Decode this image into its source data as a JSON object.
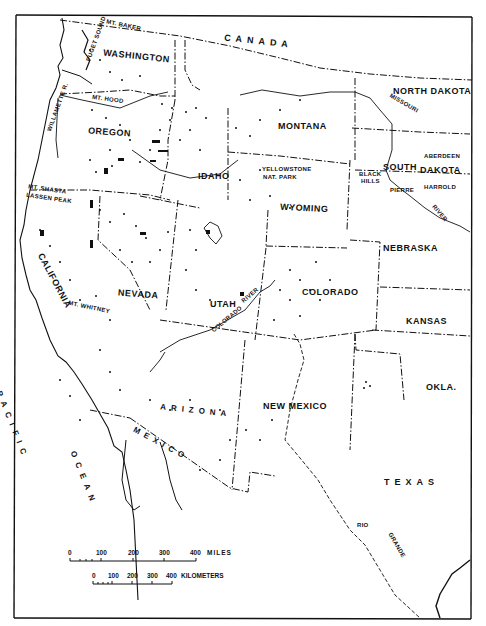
{
  "map": {
    "subject": "Western United States",
    "frame_color": "#111111",
    "background_color": "#ffffff",
    "countries": [
      {
        "name": "CANADA"
      },
      {
        "name": "MEXICO"
      }
    ],
    "ocean": {
      "name": "PACIFIC OCEAN",
      "line1": "PACIFIC",
      "line2": "OCEAN"
    },
    "states": [
      {
        "name": "WASHINGTON"
      },
      {
        "name": "OREGON"
      },
      {
        "name": "IDAHO"
      },
      {
        "name": "MONTANA"
      },
      {
        "name": "NORTH DAKOTA"
      },
      {
        "name": "SOUTH",
        "line2": "DAKOTA"
      },
      {
        "name": "WYOMING"
      },
      {
        "name": "NEBRASKA"
      },
      {
        "name": "CALIFORNIA"
      },
      {
        "name": "NEVADA"
      },
      {
        "name": "UTAH"
      },
      {
        "name": "COLORADO"
      },
      {
        "name": "KANSAS"
      },
      {
        "name": "ARIZONA"
      },
      {
        "name": "NEW MEXICO"
      },
      {
        "name": "OKLA."
      },
      {
        "name": "TEXAS"
      }
    ],
    "features": [
      {
        "name": "MT. BAKER"
      },
      {
        "name": "PUGET SOUND"
      },
      {
        "name": "MT. HOOD"
      },
      {
        "name": "WILLAMETTE R."
      },
      {
        "name": "MT. SHASTA"
      },
      {
        "name": "LASSEN PEAK"
      },
      {
        "name": "MT. WHITNEY"
      },
      {
        "name": "YELLOWSTONE"
      },
      {
        "name": "NAT. PARK"
      },
      {
        "name": "BLACK"
      },
      {
        "name": "HILLS"
      },
      {
        "name": "MISSOURI"
      },
      {
        "name": "RIVER"
      },
      {
        "name": "COLORADO"
      },
      {
        "name": "RIVER"
      },
      {
        "name": "RIO"
      },
      {
        "name": "GRANDE"
      }
    ],
    "cities": [
      {
        "name": "ABERDEEN"
      },
      {
        "name": "PIERRE"
      },
      {
        "name": "HARROLD"
      }
    ],
    "scale": {
      "miles": {
        "ticks": [
          "0",
          "100",
          "200",
          "300",
          "400"
        ],
        "unit": "MILES"
      },
      "kilometers": {
        "ticks": [
          "0",
          "100",
          "200",
          "300",
          "400"
        ],
        "unit": "KILOMETERS"
      }
    }
  }
}
